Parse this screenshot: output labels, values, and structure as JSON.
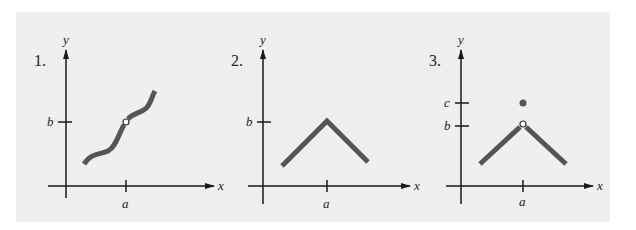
{
  "colors": {
    "panel_background": "#efefef",
    "axis": "#1a1a1a",
    "curve": "#555555",
    "open_point_fill": "#ffffff"
  },
  "graphs": [
    {
      "number": "1.",
      "x_axis_label": "x",
      "y_axis_label": "y",
      "x_ticks": [
        {
          "label": "a"
        }
      ],
      "y_ticks": [
        {
          "label": "b"
        }
      ],
      "curve_shape": "increasing wavy curve passing through (a, b)",
      "points": [
        {
          "type": "open",
          "at": "(a, b)"
        }
      ]
    },
    {
      "number": "2.",
      "x_axis_label": "x",
      "y_axis_label": "y",
      "x_ticks": [
        {
          "label": "a"
        }
      ],
      "y_ticks": [
        {
          "label": "b"
        }
      ],
      "curve_shape": "inverted V with peak at (a, b)",
      "points": []
    },
    {
      "number": "3.",
      "x_axis_label": "x",
      "y_axis_label": "y",
      "x_ticks": [
        {
          "label": "a"
        }
      ],
      "y_ticks": [
        {
          "label": "c"
        },
        {
          "label": "b"
        }
      ],
      "curve_shape": "inverted V with hole at (a, b)",
      "points": [
        {
          "type": "open",
          "at": "(a, b)"
        },
        {
          "type": "filled",
          "at": "(a, c)"
        }
      ]
    }
  ]
}
